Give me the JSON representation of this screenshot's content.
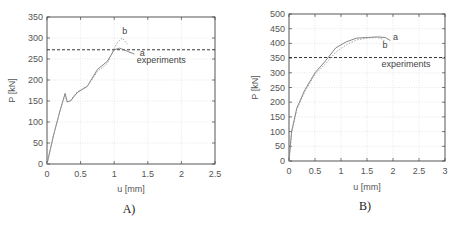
{
  "chart_data": [
    {
      "type": "line",
      "panel_label": "A)",
      "title": "",
      "xlabel": "u [mm]",
      "ylabel": "P [kN]",
      "xlim": [
        0,
        2.5
      ],
      "ylim": [
        0,
        350
      ],
      "xticks": [
        0,
        0.5,
        1,
        1.5,
        2,
        2.5
      ],
      "xtick_labels": [
        "0",
        "0.5",
        "1",
        "1.5",
        "2",
        "2.5"
      ],
      "yticks": [
        0,
        50,
        100,
        150,
        200,
        250,
        300,
        350
      ],
      "ytick_labels": [
        "0",
        "50",
        "100",
        "150",
        "200",
        "250",
        "300",
        "350"
      ],
      "grid": true,
      "series": [
        {
          "name": "a",
          "style": "solid",
          "x": [
            0,
            0.1,
            0.2,
            0.27,
            0.3,
            0.35,
            0.45,
            0.6,
            0.75,
            0.9,
            1.0,
            1.08,
            1.2,
            1.3
          ],
          "y": [
            0,
            70,
            130,
            168,
            148,
            150,
            170,
            185,
            225,
            245,
            272,
            276,
            268,
            262
          ]
        },
        {
          "name": "b",
          "style": "dotted",
          "x": [
            0,
            0.1,
            0.2,
            0.27,
            0.3,
            0.35,
            0.45,
            0.6,
            0.75,
            0.9,
            1.0,
            1.05,
            1.12,
            1.2
          ],
          "y": [
            0,
            70,
            130,
            165,
            146,
            152,
            172,
            185,
            220,
            240,
            275,
            290,
            300,
            285
          ]
        }
      ],
      "reference_lines": [
        {
          "name": "experiments",
          "y": 272,
          "style": "dashed"
        }
      ],
      "annotations": [
        {
          "text": "a",
          "x": 1.38,
          "y": 256
        },
        {
          "text": "b",
          "x": 1.12,
          "y": 310
        },
        {
          "text": "experiments",
          "x": 1.7,
          "y": 240
        }
      ]
    },
    {
      "type": "line",
      "panel_label": "B)",
      "title": "",
      "xlabel": "u [mm]",
      "ylabel": "P [kN]",
      "xlim": [
        0,
        3
      ],
      "ylim": [
        0,
        500
      ],
      "xticks": [
        0,
        0.5,
        1,
        1.5,
        2,
        2.5,
        3
      ],
      "xtick_labels": [
        "0",
        "0.5",
        "1",
        "1.5",
        "2",
        "2.5",
        "3"
      ],
      "yticks": [
        0,
        50,
        100,
        150,
        200,
        250,
        300,
        350,
        400,
        450,
        500
      ],
      "ytick_labels": [
        "0",
        "50",
        "100",
        "150",
        "200",
        "250",
        "300",
        "350",
        "400",
        "450",
        "500"
      ],
      "grid": true,
      "series": [
        {
          "name": "a",
          "style": "solid",
          "x": [
            0,
            0.05,
            0.15,
            0.3,
            0.5,
            0.7,
            0.9,
            1.1,
            1.3,
            1.5,
            1.7,
            1.85,
            1.95
          ],
          "y": [
            0,
            100,
            180,
            240,
            300,
            340,
            385,
            405,
            418,
            420,
            422,
            420,
            410
          ]
        },
        {
          "name": "b",
          "style": "dotted",
          "x": [
            0,
            0.05,
            0.15,
            0.3,
            0.5,
            0.7,
            0.9,
            1.1,
            1.3,
            1.5,
            1.7,
            1.8,
            1.85
          ],
          "y": [
            0,
            95,
            175,
            235,
            295,
            330,
            370,
            395,
            412,
            418,
            420,
            415,
            405
          ]
        }
      ],
      "reference_lines": [
        {
          "name": "experiments",
          "y": 352,
          "style": "dashed"
        }
      ],
      "annotations": [
        {
          "text": "a",
          "x": 2.0,
          "y": 410
        },
        {
          "text": "b",
          "x": 1.8,
          "y": 385
        },
        {
          "text": "experiments",
          "x": 2.25,
          "y": 320
        }
      ]
    }
  ]
}
